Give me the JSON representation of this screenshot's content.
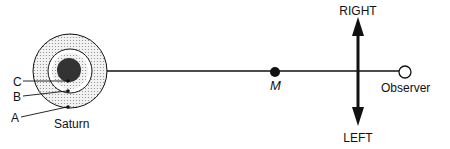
{
  "diagram": {
    "type": "saturn-observer-geometry",
    "labels": {
      "right": "RIGHT",
      "left": "LEFT",
      "moon": "M",
      "observer": "Observer",
      "planet": "Saturn",
      "point_a": "A",
      "point_b": "B",
      "point_c": "C"
    },
    "colors": {
      "stroke": "#111111",
      "ring_fill": "#e4e4e4",
      "core": "#333333",
      "background": "#ffffff"
    }
  }
}
